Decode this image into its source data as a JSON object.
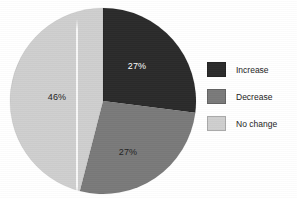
{
  "chart_data": {
    "type": "pie",
    "title": "",
    "labels": [
      "Increase",
      "Decrease",
      "No change"
    ],
    "values": [
      27,
      27,
      46
    ],
    "value_labels": [
      "27%",
      "27%",
      "46%"
    ],
    "units": "percent",
    "total": 100,
    "colors": [
      "#2b2b2b",
      "#7a7a7a",
      "#cfcfcf"
    ],
    "label_text_colors": [
      "#ffffff",
      "#232323",
      "#232323"
    ],
    "start_angle_deg": 0,
    "direction": "clockwise",
    "legend": {
      "position": "right",
      "entries": [
        {
          "label": "Increase",
          "color": "#2b2b2b",
          "value": "27%"
        },
        {
          "label": "Decrease",
          "color": "#7a7a7a",
          "value": "27%"
        },
        {
          "label": "No change",
          "color": "#cfcfcf",
          "value": "46%"
        }
      ]
    },
    "grid": false,
    "xlabel": "",
    "ylabel": ""
  },
  "slice_labels": {
    "increase": "27%",
    "decrease": "27%",
    "no_change": "46%"
  },
  "legend": {
    "increase": "Increase",
    "decrease": "Decrease",
    "no_change": "No change"
  }
}
